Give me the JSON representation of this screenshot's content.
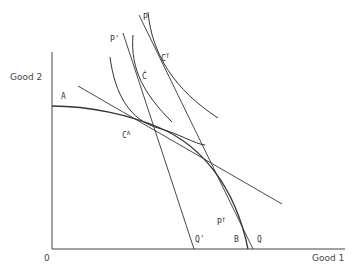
{
  "diagram": {
    "type": "trade-theory production possibility diagram",
    "axes": {
      "x_label": "Good 1",
      "y_label": "Good 2",
      "origin_label": "0"
    },
    "labels": {
      "A": "A",
      "C_A": "C",
      "C_A_sup": "A",
      "C_hat": "Ĉ",
      "C_T": "C",
      "C_T_sup": "T",
      "P": "P",
      "P_prime": "P'",
      "P_T": "P",
      "P_T_sup": "T",
      "Q": "Q",
      "Q_prime": "Q'",
      "B": "B"
    },
    "elements": [
      {
        "name": "production-possibility-frontier",
        "from": "A",
        "to": "B"
      },
      {
        "name": "autarky-price-line",
        "tangent_at": "C^A"
      },
      {
        "name": "world-price-line-PQ",
        "from": "P",
        "to": "Q",
        "tangent_at": "P^T"
      },
      {
        "name": "price-line-P-prime-Q-prime",
        "from": "P'",
        "to": "Q'"
      },
      {
        "name": "indifference-curve-autarky",
        "through": "C^A"
      },
      {
        "name": "indifference-curve-C-hat",
        "through": "Ĉ"
      },
      {
        "name": "indifference-curve-trade",
        "through": "C^T"
      }
    ]
  },
  "colors": {
    "line": "#333333",
    "text": "#444444",
    "background": "#ffffff"
  }
}
